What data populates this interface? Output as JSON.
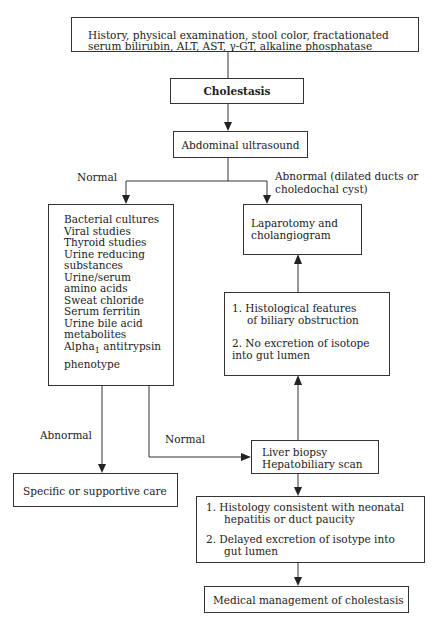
{
  "flowchart": {
    "top_box": {
      "line1": "History, physical examination, stool color, fractationated",
      "line2": "serum bilirubin, ALT, AST,   γ-GT, alkaline phosphatase"
    },
    "cholestasis": "Cholestasis",
    "ultrasound": "Abdominal ultrasound",
    "label_normal_left": "Normal",
    "label_abnormal_right_1": "Abnormal (dilated ducts or",
    "label_abnormal_right_2": "choledochal cyst)",
    "tests_box": {
      "items": [
        "Bacterial cultures",
        "Viral studies",
        "Thyroid studies",
        "Urine reducing",
        "substances",
        "Urine/serum",
        "amino acids",
        "Sweat chloride",
        "Serum ferritin",
        "Urine bile acid",
        "metabolites",
        "Alpha",
        "phenotype"
      ],
      "alpha_sub": "1",
      "alpha_rest": "antitrypsin"
    },
    "laparotomy": {
      "line1": "Laparotomy and",
      "line2": "cholangiogram"
    },
    "obstruction_box": {
      "item1_line1": "1.  Histological features",
      "item1_line2": "of  biliary obstruction",
      "item2_line1": "2.  No excretion of isotope",
      "item2_line2": "into gut lumen"
    },
    "label_abnormal_left": "Abnormal",
    "label_normal_mid": "Normal",
    "biopsy": {
      "line1": "Liver biopsy",
      "line2": "Hepatobiliary scan"
    },
    "supportive_care": "Specific or supportive care",
    "hepatitis_box": {
      "item1_line1": "1.  Histology consistent with neonatal",
      "item1_line2": "hepatitis or duct paucity",
      "item2_line1": "2.   Delayed excretion of isotype into",
      "item2_line2": "gut  lumen"
    },
    "medical_management": "Medical management of cholestasis"
  }
}
